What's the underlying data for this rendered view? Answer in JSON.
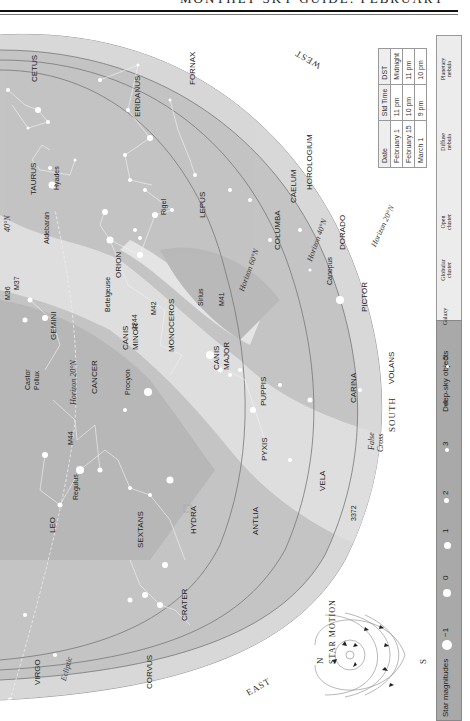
{
  "header": {
    "title": "MONTHLY SKY GUIDE: FEBRUARY"
  },
  "colors": {
    "sky_light": "#d4d4d4",
    "sky_mid": "#bdbdbd",
    "milky_way": "#dcdcdc",
    "horizon_band": "#c9c9c9",
    "star": "#ffffff",
    "legend_mag_bg": "#a9a9a9"
  },
  "directions": {
    "west": "WEST",
    "east": "EAST",
    "south": "SOUTH"
  },
  "horizons": [
    "Horizon 20°N",
    "Horizon 40°N",
    "Horizon 60°N"
  ],
  "horizon_labels": {
    "h40_upper": "40°N",
    "h20": "Horizon 20°N",
    "h60": "Horizon 60°N",
    "h40": "Horizon 40°N",
    "h20b": "Horizon 20°N"
  },
  "ecliptic": "Ecliptic",
  "constellations": {
    "cetus": "CETUS",
    "eridanus": "ERIDANUS",
    "fornax": "FORNAX",
    "taurus": "TAURUS",
    "orion": "ORION",
    "lepus": "LEPUS",
    "caelum": "CAELUM",
    "horologium": "HOROLOGIUM",
    "columba": "COLUMBA",
    "dorado": "DORADO",
    "gemini": "GEMINI",
    "canis_minor_1": "CANIS",
    "canis_minor_2": "MINOR",
    "monoceros": "MONOCEROS",
    "canis_major_1": "CANIS",
    "canis_major_2": "MAJOR",
    "pictor": "PICTOR",
    "cancer": "CANCER",
    "puppis": "PUPPIS",
    "carina": "CARINA",
    "volans": "VOLANS",
    "leo": "LEO",
    "sextans": "SEXTANS",
    "hydra": "HYDRA",
    "pyxis": "PYXIS",
    "vela": "VELA",
    "antlia": "ANTLIA",
    "crater": "CRATER",
    "corvus": "CORVUS",
    "virgo": "VIRGO"
  },
  "stars": {
    "aldebaran": "Aldebaran",
    "hyades": "Hyades",
    "rigel": "Rigel",
    "betelgeuse": "Betelgeuse",
    "sirius": "Sirius",
    "canopus": "Canopus",
    "castor": "Castor",
    "pollux": "Pollux",
    "procyon": "Procyon",
    "regulus": "Regulus"
  },
  "deep_sky": {
    "m36": "M36",
    "m37": "M37",
    "m42": "M42",
    "ngc2244": "2244",
    "m41": "M41",
    "m44": "M44",
    "ngc3372": "3372"
  },
  "asterism": {
    "false_cross_1": "False",
    "false_cross_2": "Cross"
  },
  "time_table": {
    "headers": [
      "Date",
      "Std Time",
      "DST"
    ],
    "rows": [
      [
        "February 1",
        "11 pm",
        "Midnight"
      ],
      [
        "February 15",
        "10 pm",
        "11 pm"
      ],
      [
        "March 1",
        "9 pm",
        "10 pm"
      ]
    ]
  },
  "legend": {
    "magnitudes_label": "Star magnitudes",
    "magnitudes": [
      "−1",
      "0",
      "1",
      "2",
      "3",
      "4",
      "5"
    ],
    "deep_sky_label": "Deep-sky objects",
    "deep_sky_types": [
      "Galaxy",
      "Globular cluster",
      "Open cluster",
      "Diffuse nebula",
      "Planetary nebula"
    ]
  },
  "star_motion": {
    "title": "STAR MOTION",
    "n": "N",
    "s": "S"
  }
}
